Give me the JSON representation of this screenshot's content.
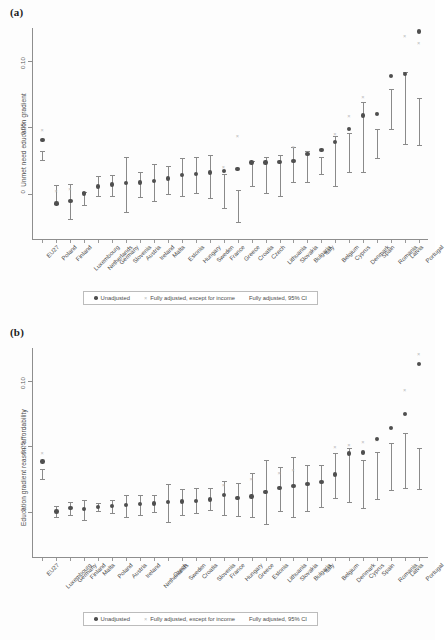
{
  "figure": {
    "panel_a_label": "(a)",
    "panel_b_label": "(b)"
  },
  "legend": {
    "unadjusted": "Unadjusted",
    "fully_adjusted_except_income": "Fully adjusted, except for income",
    "fully_adjusted_ci": "Fully adjusted, 95% CI",
    "dot_icon": "filled-circle",
    "x_icon": "x-mark"
  },
  "chart_data": [
    {
      "id": "panel-a",
      "type": "scatter",
      "title": "(a)",
      "xlabel": "",
      "ylabel": "Unmet need education gradient",
      "ylim": [
        -0.035,
        0.125
      ],
      "yticks": [
        0,
        0.05,
        0.1
      ],
      "ytick_labels": [
        "0",
        "0.05",
        "0.10"
      ],
      "grid": false,
      "legend_position": "below",
      "categories": [
        "EU27",
        "Poland",
        "Finland",
        "Luxembourg",
        "Netherlands",
        "Germany",
        "Slovenia",
        "Austria",
        "Ireland",
        "Malta",
        "Estonia",
        "Hungary",
        "Sweden",
        "France",
        "Greece",
        "Croatia",
        "Czech",
        "Lithuania",
        "Slovakia",
        "Bulgaria",
        "Italy",
        "Belgium",
        "Cyprus",
        "Denmark",
        "Spain",
        "Romania",
        "Latvia",
        "Portugal"
      ],
      "series": [
        {
          "name": "Unadjusted",
          "marker": "circle",
          "values": [
            0.0405,
            -0.0075,
            -0.0055,
            0.0,
            0.0055,
            0.007,
            0.008,
            0.0085,
            0.0095,
            0.0115,
            0.014,
            0.015,
            0.016,
            0.017,
            0.0185,
            0.0235,
            0.0235,
            0.024,
            0.0245,
            0.03,
            0.033,
            0.039,
            0.049,
            0.059,
            0.06,
            0.089,
            0.0905,
            0.1225
          ]
        },
        {
          "name": "Fully adjusted, except for income",
          "marker": "x",
          "values": [
            0.047,
            0.0015,
            0.0025,
            null,
            null,
            null,
            null,
            null,
            null,
            null,
            null,
            null,
            null,
            0.0195,
            0.0425,
            null,
            null,
            null,
            0.0345,
            null,
            null,
            0.044,
            0.0575,
            0.0725,
            0.06,
            null,
            0.118,
            0.113
          ]
        },
        {
          "name": "Fully adjusted, 95% CI",
          "marker": "errorbar",
          "point": [
            0.029,
            -0.002,
            -0.006,
            -0.004,
            0.006,
            0.006,
            0.0075,
            0.007,
            0.0085,
            0.0105,
            0.0125,
            0.014,
            0.0135,
            0.002,
            -0.0045,
            0.0155,
            0.014,
            0.014,
            0.018,
            0.0205,
            0.0215,
            0.0245,
            0.031,
            0.043,
            0.038,
            0.064,
            0.065,
            0.0545
          ],
          "lower": [
            0.0255,
            -0.0075,
            -0.019,
            -0.0085,
            -0.0015,
            -0.002,
            -0.0135,
            -0.0025,
            -0.0055,
            0.0,
            -0.002,
            0.0005,
            -0.003,
            -0.011,
            -0.0215,
            0.006,
            0.0005,
            -0.0015,
            0.009,
            0.0085,
            0.015,
            0.0055,
            0.0165,
            0.0165,
            0.027,
            0.049,
            0.0375,
            0.037
          ],
          "upper": [
            0.0325,
            0.0065,
            0.0075,
            0.001,
            0.013,
            0.014,
            0.028,
            0.0165,
            0.0225,
            0.0205,
            0.027,
            0.0275,
            0.0295,
            0.015,
            0.003,
            0.025,
            0.0275,
            0.0295,
            0.0355,
            0.032,
            0.0275,
            0.0435,
            0.0455,
            0.0695,
            0.049,
            0.079,
            0.092,
            0.072
          ]
        }
      ]
    },
    {
      "id": "panel-b",
      "type": "scatter",
      "title": "(b)",
      "xlabel": "",
      "ylabel": "Education gradient  reason: affordability",
      "ylim": [
        -0.035,
        0.125
      ],
      "yticks": [
        0,
        0.05,
        0.1
      ],
      "ytick_labels": [
        "0",
        "0.05",
        "0.10"
      ],
      "grid": false,
      "legend_position": "below",
      "categories": [
        "EU27",
        "Luxembourg",
        "Germany",
        "Finland",
        "Malta",
        "Poland",
        "Austria",
        "Ireland",
        "Netherlands",
        "Czech",
        "Sweden",
        "Croatia",
        "Slovenia",
        "France",
        "Hungary",
        "Greece",
        "Estonia",
        "Lithuania",
        "Slovakia",
        "Bulgaria",
        "Italy",
        "Belgium",
        "Denmark",
        "Cyprus",
        "Spain",
        "Romania",
        "Latvia",
        "Portugal"
      ],
      "series": [
        {
          "name": "Unadjusted",
          "marker": "circle",
          "values": [
            0.0385,
            0.0005,
            0.003,
            0.0025,
            0.004,
            0.0045,
            0.0055,
            0.006,
            0.0065,
            0.0075,
            0.008,
            0.0085,
            0.0095,
            0.013,
            0.0105,
            0.012,
            0.0155,
            0.0185,
            0.02,
            0.0215,
            0.023,
            0.0285,
            0.0445,
            0.0455,
            0.0555,
            0.064,
            0.0745,
            0.113
          ]
        },
        {
          "name": "Fully adjusted, except for income",
          "marker": "x",
          "values": [
            0.044,
            null,
            null,
            null,
            null,
            null,
            null,
            null,
            null,
            null,
            null,
            null,
            null,
            0.0195,
            null,
            0.0245,
            null,
            0.029,
            0.031,
            null,
            null,
            0.049,
            0.05,
            0.0525,
            0.0545,
            null,
            0.092,
            0.12
          ]
        },
        {
          "name": "Fully adjusted, 95% CI",
          "marker": "errorbar",
          "point": [
            0.029,
            0.0,
            0.0025,
            0.002,
            0.0035,
            0.004,
            0.005,
            0.0055,
            0.0065,
            0.007,
            0.008,
            0.0085,
            0.0095,
            0.011,
            0.0095,
            0.013,
            0.016,
            0.018,
            0.0195,
            0.0185,
            0.02,
            0.028,
            0.0285,
            0.0215,
            0.028,
            0.0345,
            0.039,
            0.0335
          ],
          "lower": [
            0.025,
            -0.004,
            -0.002,
            -0.006,
            0.0005,
            -0.0005,
            -0.0035,
            -0.0025,
            0.0,
            -0.0075,
            -0.002,
            -0.001,
            0.0015,
            -0.002,
            -0.003,
            -0.004,
            -0.009,
            0.001,
            -0.0035,
            0.0005,
            0.004,
            0.0105,
            0.008,
            0.003,
            0.01,
            0.017,
            0.0185,
            0.0175
          ],
          "upper": [
            0.0325,
            0.0045,
            0.0075,
            0.009,
            0.007,
            0.009,
            0.013,
            0.013,
            0.013,
            0.0215,
            0.0175,
            0.018,
            0.018,
            0.0235,
            0.0225,
            0.0295,
            0.04,
            0.0345,
            0.042,
            0.036,
            0.036,
            0.045,
            0.049,
            0.0395,
            0.046,
            0.053,
            0.0605,
            0.049
          ]
        }
      ]
    }
  ]
}
